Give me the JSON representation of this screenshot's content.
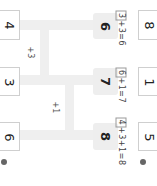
{
  "left_boxes": [
    "4",
    "3",
    "6"
  ],
  "gray_boxes": [
    "6",
    "7",
    "8"
  ],
  "right_boxes": [
    "8",
    "1",
    "5"
  ],
  "steps": [
    "+3",
    "+1"
  ],
  "equations": [
    {
      "boxed": "3",
      "rest": "+3=6"
    },
    {
      "boxed": "6",
      "rest": "+1=7"
    },
    {
      "boxed": "4",
      "rest": "+3+1=8"
    }
  ],
  "markers": [
    "❸",
    "❹"
  ],
  "colors": {
    "track": "#efefef",
    "gray_box": "#eeeeee",
    "border": "#cfcfcf"
  }
}
